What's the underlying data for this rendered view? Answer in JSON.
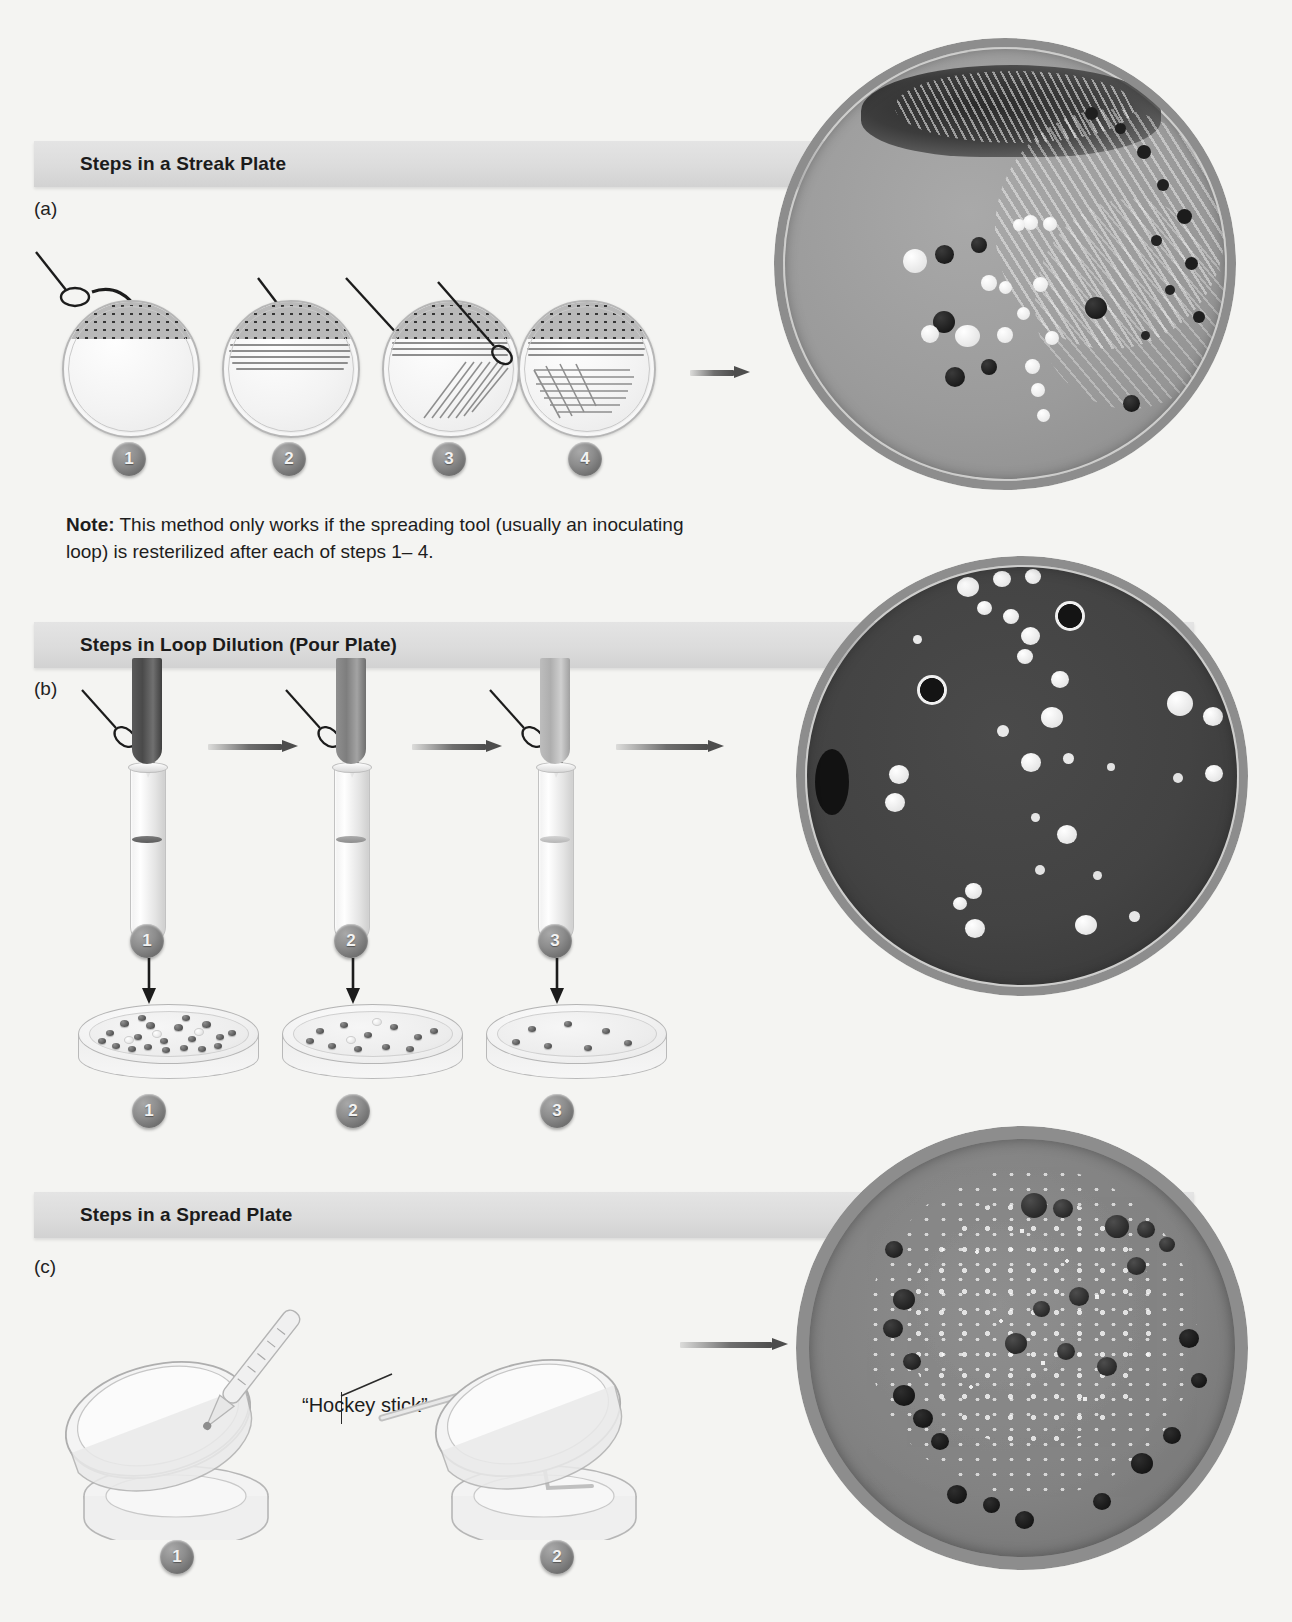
{
  "figure": {
    "background_color": "#f4f4f2",
    "banner_color": "#dcdcdc",
    "badge_color": "#6f6f6f"
  },
  "sections": [
    {
      "id": "streak",
      "letter": "(a)",
      "banner": "Steps in a Streak Plate",
      "steps": [
        {
          "number": "1",
          "caption": ""
        },
        {
          "number": "2",
          "caption": ""
        },
        {
          "number": "3",
          "caption": ""
        },
        {
          "number": "4",
          "caption": ""
        }
      ],
      "note_prefix": "Note:",
      "note_text": " This method only works if the spreading tool (usually an inoculating loop) is resterilized after each of steps 1– 4.",
      "photo_caption": ""
    },
    {
      "id": "pour",
      "letter": "(b)",
      "banner": "Steps in Loop Dilution (Pour Plate)",
      "tube_steps": [
        {
          "number": "1"
        },
        {
          "number": "2"
        },
        {
          "number": "3"
        }
      ],
      "dish_steps": [
        {
          "number": "1"
        },
        {
          "number": "2"
        },
        {
          "number": "3"
        }
      ]
    },
    {
      "id": "spread",
      "letter": "(c)",
      "banner": "Steps in a Spread Plate",
      "tool_label": "“Hockey stick”",
      "steps": [
        {
          "number": "1"
        },
        {
          "number": "2"
        }
      ]
    }
  ],
  "photos": [
    {
      "name": "streak-plate-photo",
      "alt": "Streak plate with dense growth and isolated colonies"
    },
    {
      "name": "pour-plate-photo",
      "alt": "Pour plate with scattered subsurface colonies"
    },
    {
      "name": "spread-plate-photo",
      "alt": "Spread plate with evenly distributed colonies"
    }
  ]
}
